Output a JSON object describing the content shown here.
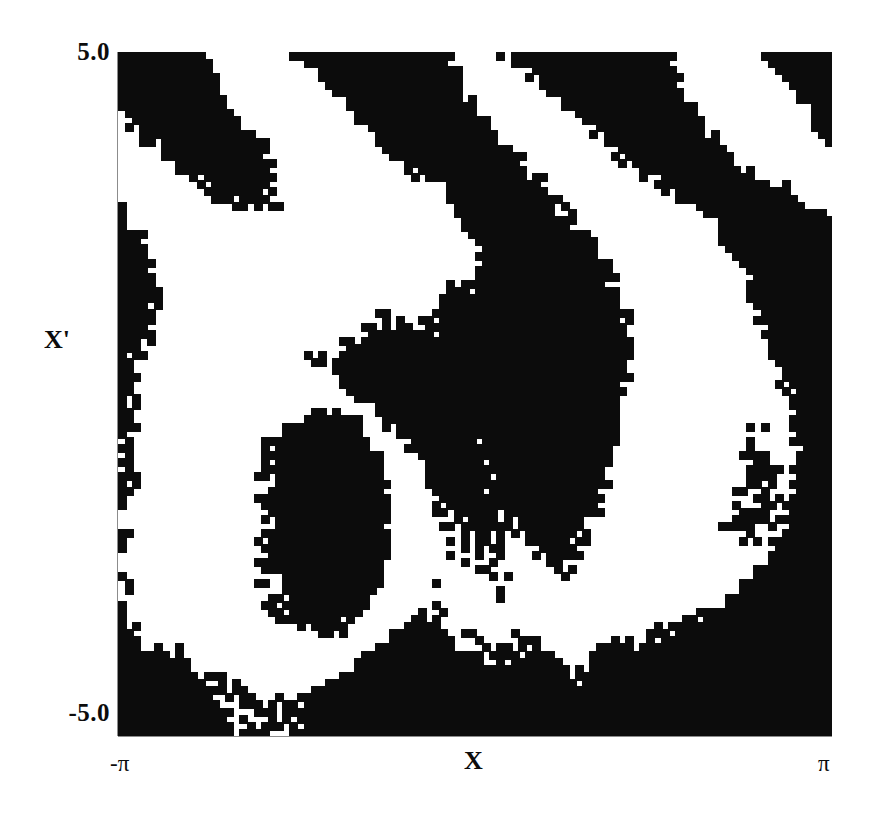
{
  "figure": {
    "title": "",
    "background_color": "#ffffff",
    "ink_color": "#0c0c0c"
  },
  "axes": {
    "x": {
      "label": "X",
      "tick_labels": [
        "-π",
        "π"
      ],
      "min_label": "-π",
      "max_label": "π",
      "range": [
        -3.14159265,
        3.14159265
      ]
    },
    "y": {
      "label": "X'",
      "tick_labels": [
        "5.0",
        "-5.0"
      ],
      "max_label": "5.0",
      "min_label": "-5.0",
      "range": [
        -5.0,
        5.0
      ]
    }
  },
  "chart_data": {
    "type": "heatmap",
    "title": "",
    "xlabel": "X",
    "ylabel": "X'",
    "xlim": [
      -3.14159265,
      3.14159265
    ],
    "ylim": [
      -5.0,
      5.0
    ],
    "xtick_labels": [
      "-π",
      "π"
    ],
    "ytick_labels": [
      "-5.0",
      "5.0"
    ],
    "grid": false,
    "legend": "none",
    "colormap": "binary",
    "colors": [
      "#ffffff",
      "#0c0c0c"
    ],
    "value_labels": {
      "0": "white",
      "1": "black"
    },
    "nx": 100,
    "ny": 96,
    "cell_width_px": 7.14,
    "cell_height_px": 7.125,
    "generator": {
      "kind": "standard-map-phase",
      "k": 1.35,
      "phase_scale": 1.0,
      "threshold": 0.0,
      "noise_amplitude": 0.3,
      "seed": 20240517
    },
    "features": [
      {
        "name": "central-black-lobe",
        "x_center": 0.45,
        "y_center": -0.6,
        "fill": "black"
      },
      {
        "name": "inner-white-spiral-arm",
        "x_center": -1.6,
        "y_center": -1.9,
        "fill": "white"
      },
      {
        "name": "upper-left-white-basin",
        "x_center": -1.2,
        "y_center": 1.9,
        "fill": "white"
      },
      {
        "name": "upper-right-diagonal-bands",
        "x_center": 1.9,
        "y_center": 3.4,
        "fill": "alternating"
      },
      {
        "name": "lower-right-filaments",
        "x_center": 2.3,
        "y_center": -1.6,
        "fill": "alternating"
      },
      {
        "name": "bottom-solid-black",
        "x_center": 0.0,
        "y_center": -4.4,
        "fill": "black"
      }
    ]
  }
}
